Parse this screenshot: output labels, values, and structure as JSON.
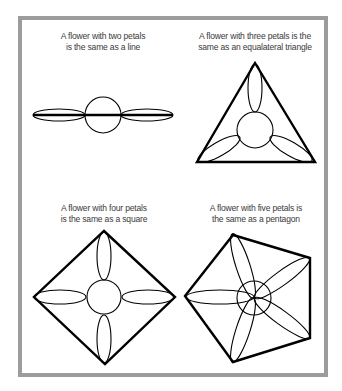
{
  "panels": [
    {
      "id": "two-petals",
      "caption_lines": [
        "A flower with two petals",
        "is the same as a line"
      ],
      "shape": "line",
      "petal_count": 2
    },
    {
      "id": "three-petals",
      "caption_lines": [
        "A flower with three petals is the",
        "same as an equalateral triangle"
      ],
      "shape": "triangle",
      "petal_count": 3
    },
    {
      "id": "four-petals",
      "caption_lines": [
        "A flower with four petals",
        "is the same as a square"
      ],
      "shape": "square",
      "petal_count": 4
    },
    {
      "id": "five-petals",
      "caption_lines": [
        "A flower with five petals is",
        "the same as a pentagon"
      ],
      "shape": "pentagon",
      "petal_count": 5
    }
  ],
  "colors": {
    "frame": "#9c9c9c",
    "stroke": "#000000",
    "text": "#3a3a3a"
  }
}
